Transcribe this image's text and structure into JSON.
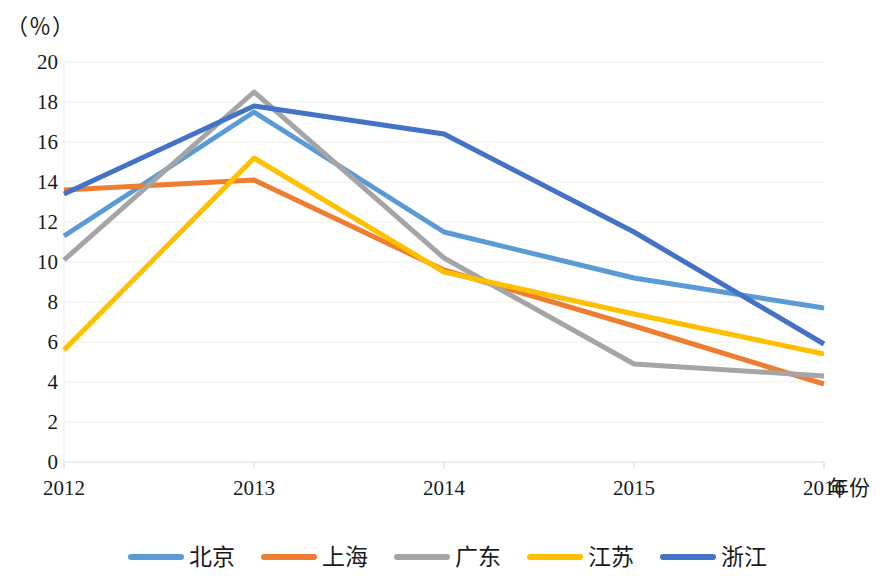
{
  "chart_data": {
    "type": "line",
    "title": "",
    "subtitle": "",
    "xlabel": "年份",
    "ylabel": "（％）",
    "unit_label": "（％）",
    "categories": [
      "2012",
      "2013",
      "2014",
      "2015",
      "2016"
    ],
    "x": [
      2012,
      2013,
      2014,
      2015,
      2016
    ],
    "xlim": [
      2012,
      2016
    ],
    "ylim": [
      0,
      20
    ],
    "y_ticks": [
      0,
      2,
      4,
      6,
      8,
      10,
      12,
      14,
      16,
      18,
      20
    ],
    "y_tick_labels": [
      "0",
      "2",
      "4",
      "6",
      "8",
      "10",
      "12",
      "14",
      "16",
      "18",
      "20"
    ],
    "grid": true,
    "grid_axis": "y",
    "legend_position": "bottom",
    "series": [
      {
        "name": "北京",
        "color": "#5B9BD5",
        "values": [
          11.3,
          17.5,
          11.5,
          9.2,
          7.7
        ]
      },
      {
        "name": "上海",
        "color": "#ED7D31",
        "values": [
          13.6,
          14.1,
          9.6,
          6.8,
          3.9
        ]
      },
      {
        "name": "广东",
        "color": "#A5A5A5",
        "values": [
          10.1,
          18.5,
          10.2,
          4.9,
          4.3
        ]
      },
      {
        "name": "江苏",
        "color": "#FFC000",
        "values": [
          5.6,
          15.2,
          9.5,
          7.4,
          5.4
        ]
      },
      {
        "name": "浙江",
        "color": "#4472C4",
        "values": [
          13.4,
          17.8,
          16.4,
          11.5,
          5.9
        ]
      }
    ]
  },
  "style": {
    "grid_color": "#EDEDE8",
    "axis_color": "#D9D9D9",
    "text_color": "#1a1a1a",
    "background": "#FFFFFF",
    "line_width": 5
  }
}
